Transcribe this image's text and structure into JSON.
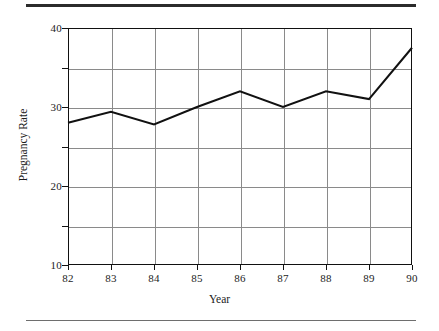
{
  "figure": {
    "y_axis_title": "Pregnancy Rate",
    "x_axis_title": "Year"
  },
  "decorations": {
    "top_rule": "horizontal-rule",
    "bottom_rule": "horizontal-rule"
  },
  "chart_data": {
    "type": "line",
    "title": "",
    "subtitle": "",
    "xlabel": "Year",
    "ylabel": "Pregnancy Rate",
    "categories": [
      "82",
      "83",
      "84",
      "85",
      "86",
      "87",
      "88",
      "89",
      "90"
    ],
    "values": [
      28,
      29.4,
      27.8,
      30,
      32,
      30,
      32,
      31,
      37.5
    ],
    "series": [
      {
        "name": "Pregnancy Rate",
        "values": [
          28,
          29.4,
          27.8,
          30,
          32,
          30,
          32,
          31,
          37.5
        ]
      }
    ],
    "ylim": [
      10,
      40
    ],
    "y_major_ticks": [
      10,
      20,
      30,
      40
    ],
    "y_gridlines": [
      10,
      15,
      20,
      25,
      30,
      35,
      40
    ],
    "y_tick_labels": [
      "10",
      "20",
      "30",
      "40"
    ],
    "x_tick_labels": [
      "82",
      "83",
      "84",
      "85",
      "86",
      "87",
      "88",
      "89",
      "90"
    ],
    "grid": true,
    "legend": false,
    "legend_position": "none",
    "line_color": "#111111",
    "grid_color": "#8a8a8a",
    "axis_color": "#111111",
    "background_color": "#ffffff",
    "markers": false,
    "annotations": []
  }
}
